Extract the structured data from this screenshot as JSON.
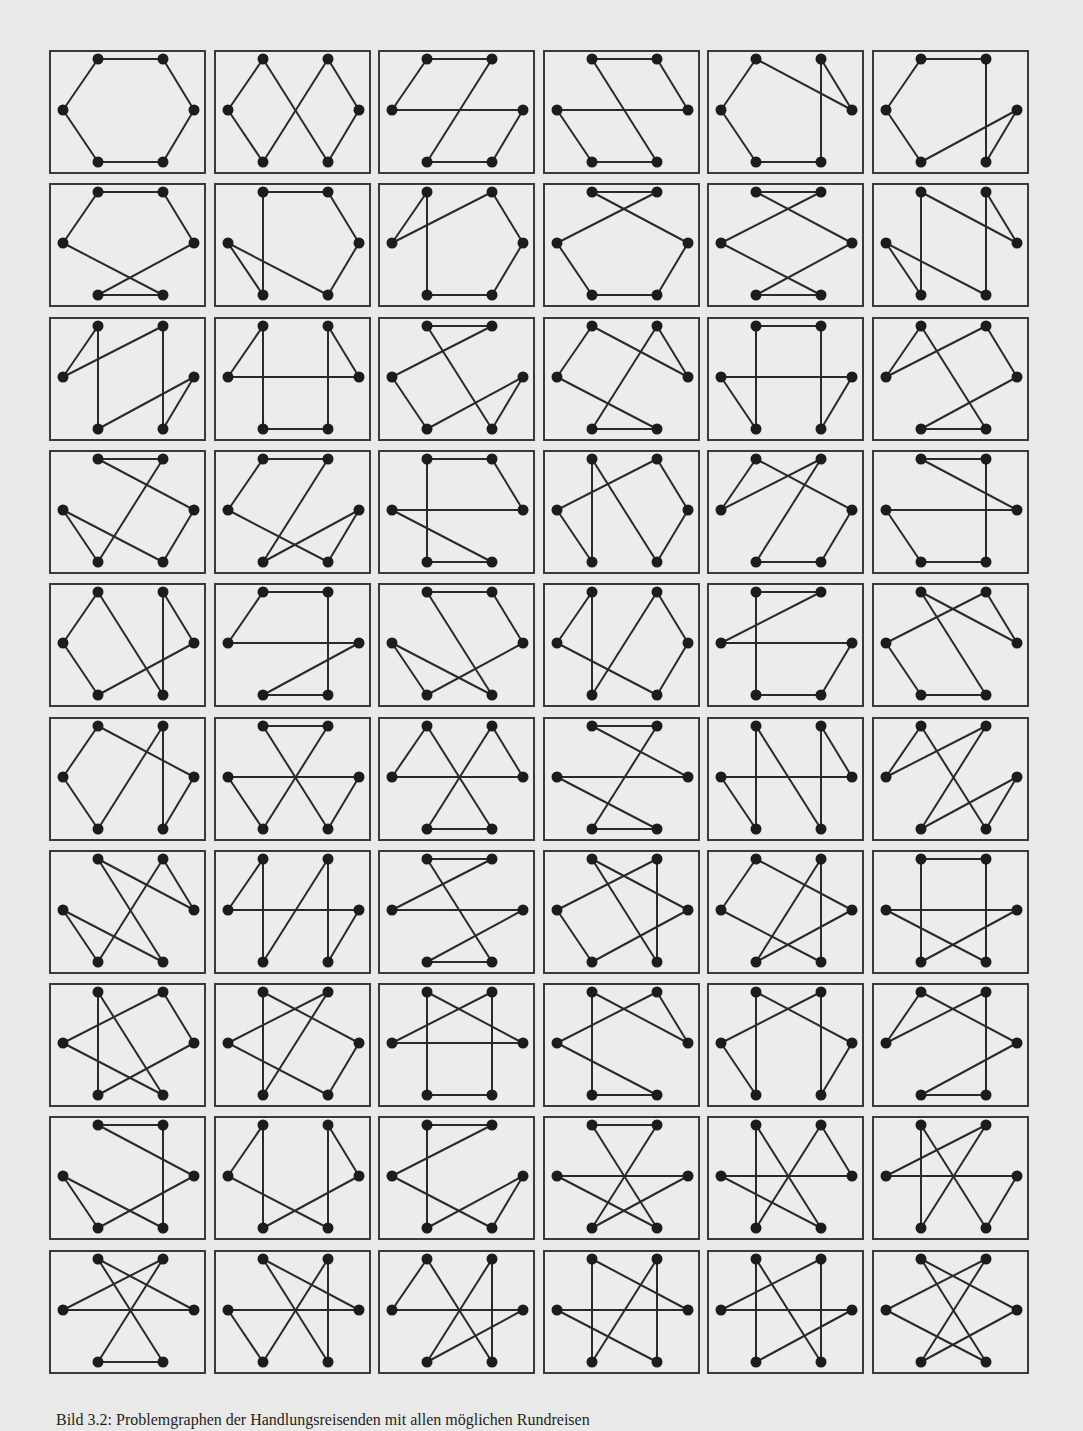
{
  "figure": {
    "caption": "Bild 3.2: Problemgraphen der Handlungsreisenden mit allen möglichen Rundreisen",
    "rows": 10,
    "columns": 6,
    "node_labels": [
      "TL",
      "TR",
      "R",
      "BR",
      "BL",
      "L"
    ],
    "node_positions": [
      [
        49,
        9
      ],
      [
        114,
        9
      ],
      [
        145,
        60
      ],
      [
        114,
        112
      ],
      [
        49,
        112
      ],
      [
        14,
        60
      ]
    ],
    "panel_size": [
      157,
      124
    ],
    "panel_origin": [
      49,
      50
    ],
    "panel_pitch": [
      164.6,
      133.3
    ],
    "colors": {
      "background": "#e9e9e7",
      "panel_fill": "#ececea",
      "panel_border": "#3a3a3a",
      "edge": "#2a2a2a",
      "node": "#1c1c1c"
    },
    "tours": [
      [
        0,
        1,
        2,
        3,
        4,
        5
      ],
      [
        5,
        0,
        3,
        2,
        1,
        4
      ],
      [
        0,
        1,
        4,
        3,
        2,
        5
      ],
      [
        0,
        1,
        2,
        5,
        4,
        3
      ],
      [
        0,
        5,
        4,
        3,
        1,
        2
      ],
      [
        0,
        1,
        3,
        2,
        4,
        5
      ],
      [
        0,
        1,
        2,
        4,
        3,
        5
      ],
      [
        0,
        1,
        2,
        3,
        5,
        4
      ],
      [
        0,
        5,
        1,
        2,
        3,
        4
      ],
      [
        0,
        1,
        5,
        4,
        3,
        2
      ],
      [
        0,
        1,
        5,
        3,
        4,
        2
      ],
      [
        0,
        4,
        5,
        3,
        1,
        2
      ],
      [
        0,
        5,
        1,
        3,
        2,
        4
      ],
      [
        0,
        5,
        2,
        1,
        3,
        4
      ],
      [
        0,
        1,
        5,
        4,
        2,
        3
      ],
      [
        0,
        5,
        3,
        4,
        1,
        2
      ],
      [
        0,
        1,
        3,
        2,
        5,
        4
      ],
      [
        0,
        5,
        1,
        2,
        4,
        3
      ],
      [
        0,
        1,
        4,
        5,
        3,
        2
      ],
      [
        0,
        1,
        4,
        2,
        3,
        5
      ],
      [
        0,
        1,
        2,
        5,
        3,
        4
      ],
      [
        0,
        4,
        5,
        1,
        2,
        3
      ],
      [
        0,
        5,
        1,
        4,
        3,
        2
      ],
      [
        0,
        1,
        3,
        4,
        5,
        2
      ],
      [
        0,
        5,
        4,
        2,
        1,
        3
      ],
      [
        0,
        1,
        3,
        4,
        2,
        5
      ],
      [
        0,
        1,
        2,
        4,
        5,
        3
      ],
      [
        0,
        5,
        3,
        2,
        1,
        4
      ],
      [
        0,
        1,
        5,
        2,
        3,
        4
      ],
      [
        0,
        2,
        1,
        5,
        4,
        3
      ],
      [
        0,
        5,
        4,
        1,
        3,
        2
      ],
      [
        0,
        1,
        4,
        5,
        2,
        3
      ],
      [
        0,
        5,
        2,
        1,
        4,
        3
      ],
      [
        0,
        1,
        4,
        3,
        5,
        2
      ],
      [
        0,
        4,
        5,
        2,
        1,
        3
      ],
      [
        0,
        5,
        1,
        4,
        2,
        3
      ],
      [
        0,
        2,
        1,
        4,
        5,
        3
      ],
      [
        0,
        5,
        2,
        3,
        1,
        4
      ],
      [
        0,
        1,
        5,
        2,
        4,
        3
      ],
      [
        0,
        2,
        4,
        5,
        1,
        3
      ],
      [
        0,
        5,
        3,
        1,
        4,
        2
      ],
      [
        0,
        1,
        3,
        5,
        2,
        4
      ],
      [
        0,
        4,
        2,
        1,
        5,
        3
      ],
      [
        0,
        2,
        3,
        5,
        1,
        4
      ],
      [
        0,
        2,
        5,
        1,
        3,
        4
      ],
      [
        0,
        2,
        1,
        5,
        3,
        4
      ],
      [
        0,
        2,
        3,
        1,
        5,
        4
      ],
      [
        0,
        5,
        1,
        3,
        4,
        2
      ],
      [
        0,
        1,
        3,
        5,
        4,
        2
      ],
      [
        0,
        5,
        3,
        1,
        2,
        4
      ],
      [
        0,
        1,
        5,
        3,
        2,
        4
      ],
      [
        0,
        1,
        4,
        2,
        5,
        3
      ],
      [
        0,
        4,
        1,
        2,
        5,
        3
      ],
      [
        0,
        4,
        1,
        5,
        2,
        3
      ],
      [
        0,
        2,
        5,
        1,
        4,
        3
      ],
      [
        0,
        2,
        5,
        4,
        1,
        3
      ],
      [
        0,
        5,
        2,
        4,
        1,
        3
      ],
      [
        0,
        4,
        1,
        3,
        5,
        2
      ],
      [
        0,
        4,
        2,
        5,
        1,
        3
      ],
      [
        0,
        2,
        4,
        1,
        5,
        3
      ]
    ]
  }
}
